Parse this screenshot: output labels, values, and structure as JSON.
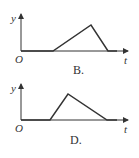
{
  "graphs": [
    {
      "option": "B.",
      "y_label": "y",
      "x_label": "t",
      "origin_label": "O",
      "shape": "flat, slow linear rise to peak, faster linear fall to zero, flat",
      "points": [
        [
          21,
          51
        ],
        [
          53,
          51
        ],
        [
          91,
          25
        ],
        [
          108,
          51
        ],
        [
          117,
          51
        ]
      ]
    },
    {
      "option": "D.",
      "y_label": "y",
      "x_label": "t",
      "origin_label": "O",
      "shape": "flat, fast linear rise to peak, slower linear fall to zero, flat",
      "points": [
        [
          21,
          120
        ],
        [
          50,
          120
        ],
        [
          68,
          94
        ],
        [
          107,
          120
        ],
        [
          117,
          120
        ]
      ]
    }
  ],
  "colors": {
    "line": "#333333"
  }
}
